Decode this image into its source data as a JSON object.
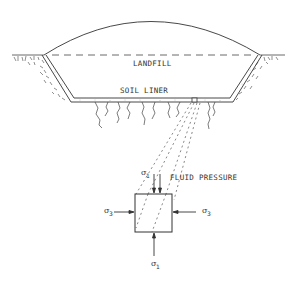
{
  "diagram": {
    "type": "landfill cross-section with stress element",
    "labels": {
      "landfill": "LANDFILL",
      "soil_liner": "SOIL LINER",
      "fluid_pressure": "FLUID PRESSURE",
      "sigma1_top": "σ",
      "sigma1_top_sub": "1",
      "sigma1_bottom": "σ",
      "sigma1_bottom_sub": "1",
      "sigma3_left": "σ",
      "sigma3_left_sub": "3",
      "sigma3_right": "σ",
      "sigma3_right_sub": "3"
    },
    "colors": {
      "line": "#333333",
      "background": "#ffffff"
    }
  }
}
